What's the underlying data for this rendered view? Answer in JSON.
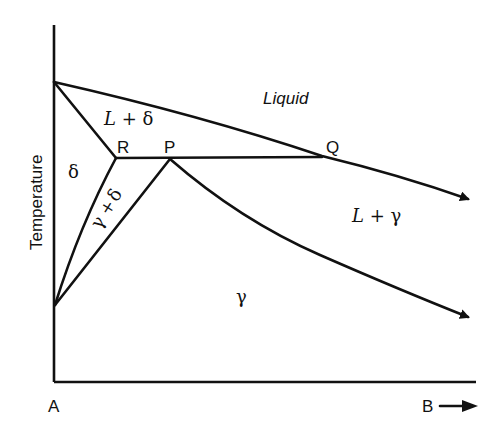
{
  "diagram": {
    "type": "binary phase diagram (peritectic)",
    "axes": {
      "y_label": "Temperature",
      "x_origin_label": "A",
      "x_end_label": "B",
      "x_end_arrow": "→"
    },
    "points": {
      "R": "R",
      "P": "P",
      "Q": "Q"
    },
    "regions": {
      "liquid": "Liquid",
      "l_plus_delta": "L + δ",
      "delta": "δ",
      "gamma_plus_delta": {
        "gamma": "γ",
        "plus": "+",
        "delta": "δ"
      },
      "l_plus_gamma": "L + γ",
      "gamma": "γ"
    },
    "colors": {
      "line": "#111111",
      "background": "#ffffff"
    }
  }
}
